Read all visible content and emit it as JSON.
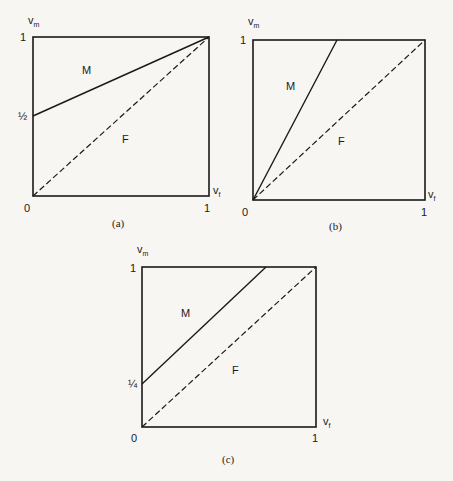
{
  "figure": {
    "panels": [
      {
        "caption": "(a)",
        "y_axis_label": "v",
        "y_axis_sub": "m",
        "x_axis_label": "v",
        "x_axis_sub": "f",
        "origin_label": "0",
        "x_max_label": "1",
        "y_max_label": "1",
        "y_intercept_label": "½",
        "region_upper": "M",
        "region_lower": "F",
        "solid_line": {
          "from": [
            0,
            0.5
          ],
          "to": [
            1,
            1
          ]
        },
        "dashed_line": {
          "from": [
            0,
            0
          ],
          "to": [
            1,
            1
          ]
        }
      },
      {
        "caption": "(b)",
        "y_axis_label": "v",
        "y_axis_sub": "m",
        "x_axis_label": "v",
        "x_axis_sub": "f",
        "origin_label": "0",
        "x_max_label": "1",
        "y_max_label": "1",
        "region_upper": "M",
        "region_lower": "F",
        "solid_line": {
          "from": [
            0,
            0
          ],
          "to": [
            0.5,
            1
          ]
        },
        "dashed_line": {
          "from": [
            0,
            0
          ],
          "to": [
            1,
            1
          ]
        }
      },
      {
        "caption": "(c)",
        "y_axis_label": "v",
        "y_axis_sub": "m",
        "x_axis_label": "v",
        "x_axis_sub": "f",
        "origin_label": "0",
        "x_max_label": "1",
        "y_max_label": "1",
        "y_intercept_label": "¼",
        "region_upper": "M",
        "region_lower": "F",
        "solid_line": {
          "from": [
            0,
            0.25
          ],
          "to": [
            0.75,
            1
          ]
        },
        "dashed_line": {
          "from": [
            0,
            0
          ],
          "to": [
            1,
            1
          ]
        }
      }
    ]
  }
}
